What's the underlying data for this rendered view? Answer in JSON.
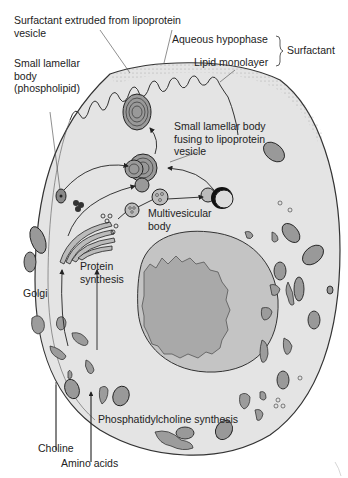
{
  "colors": {
    "background": "#ffffff",
    "cytoplasm": "#e4e4e4",
    "membrane_stroke": "#333333",
    "nucleus": "#a9a9a9",
    "nuclear_envelope": "#8c8c8c",
    "er": "#9c9c9c",
    "organelle_stroke": "#333333",
    "label_text": "#222222"
  },
  "labels": {
    "surfactant_extruded": "Surfactant extruded from lipoprotein vesicle",
    "small_lamellar_body": "Small lamellar body (phospholipid)",
    "aqueous_hypophase": "Aqueous hypophase",
    "lipid_monolayer": "Lipid monolayer",
    "surfactant": "Surfactant",
    "lamellar_fusing": "Small lamellar body fusing to lipoprotein vesicle",
    "multivesicular_body": "Multivesicular body",
    "protein_synthesis": "Protein synthesis",
    "golgi": "Golgi",
    "phosphatidylcholine_synthesis": "Phosphatidylcholine synthesis",
    "choline": "Choline",
    "amino_acids": "Amino acids"
  }
}
